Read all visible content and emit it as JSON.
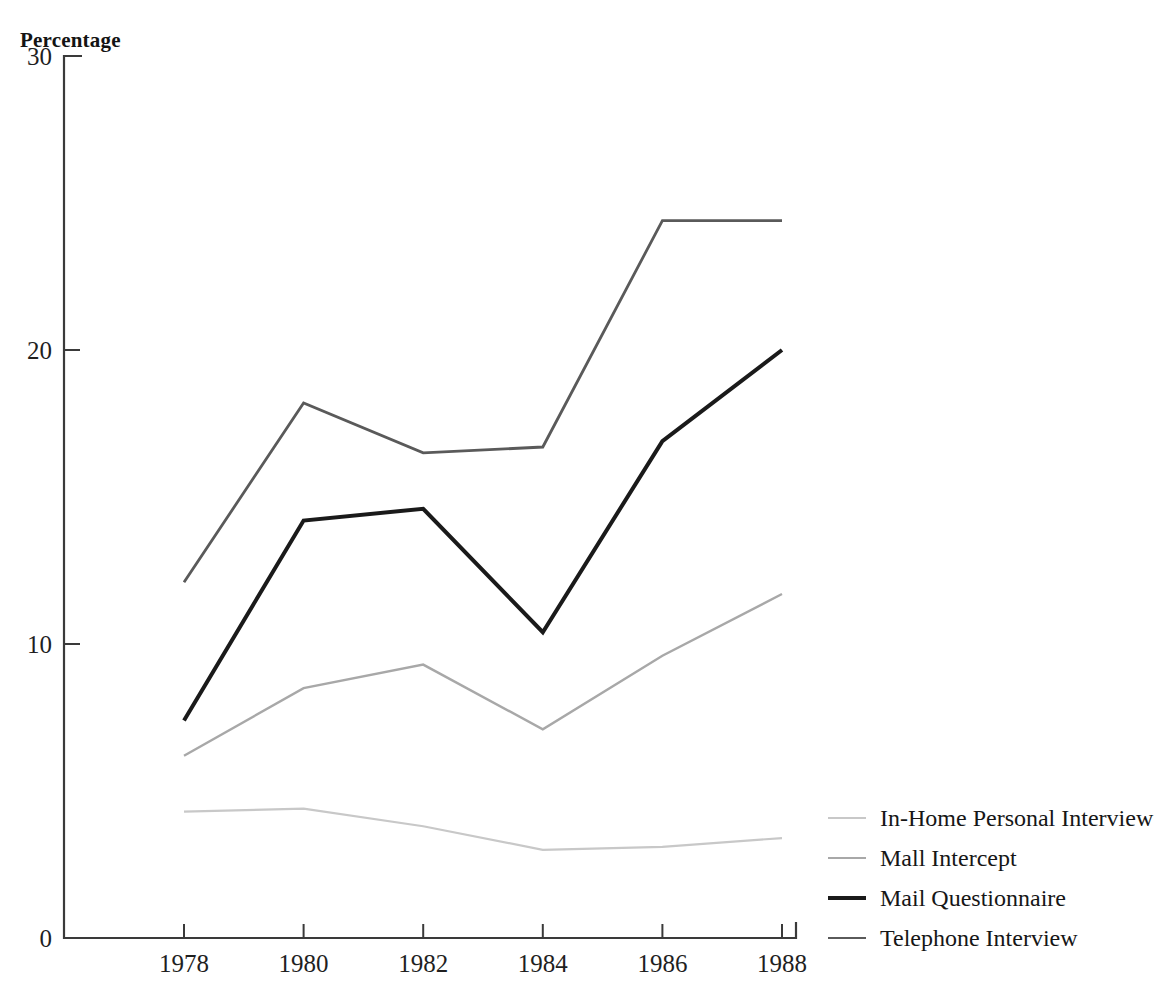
{
  "axis_title": "Percentage",
  "legend": {
    "items": [
      {
        "label": "In-Home Personal Interview",
        "color": "#c8c8c8",
        "width": 2.2
      },
      {
        "label": "Mall Intercept",
        "color": "#a8a8a8",
        "width": 2.4
      },
      {
        "label": "Mail Questionnaire",
        "color": "#1a1a1a",
        "width": 4.0
      },
      {
        "label": "Telephone Interview",
        "color": "#5a5a5a",
        "width": 2.8
      }
    ]
  },
  "chart_data": {
    "type": "line",
    "title": "",
    "subtitle": "",
    "xlabel": "",
    "ylabel": "Percentage",
    "x": [
      1978,
      1980,
      1982,
      1984,
      1986,
      1988
    ],
    "xtick_labels": [
      "1978",
      "1980",
      "1982",
      "1984",
      "1986",
      "1988"
    ],
    "ytick_labels": [
      "0",
      "10",
      "20",
      "30"
    ],
    "yticks": [
      0,
      10,
      20,
      30
    ],
    "xlim": [
      1978,
      1988
    ],
    "ylim": [
      0,
      30
    ],
    "grid": false,
    "legend_position": "right-bottom",
    "series": [
      {
        "name": "In-Home Personal Interview",
        "color": "#c8c8c8",
        "width": 2.2,
        "values": [
          4.3,
          4.4,
          3.8,
          3.0,
          3.1,
          3.4
        ]
      },
      {
        "name": "Mall Intercept",
        "color": "#a8a8a8",
        "width": 2.4,
        "values": [
          6.2,
          8.5,
          9.3,
          7.1,
          9.6,
          11.7
        ]
      },
      {
        "name": "Mail Questionnaire",
        "color": "#1a1a1a",
        "width": 4.0,
        "values": [
          7.4,
          14.2,
          14.6,
          10.4,
          16.9,
          20.0
        ]
      },
      {
        "name": "Telephone Interview",
        "color": "#5a5a5a",
        "width": 2.8,
        "values": [
          12.1,
          18.2,
          16.5,
          16.7,
          24.4,
          24.4
        ]
      }
    ]
  }
}
